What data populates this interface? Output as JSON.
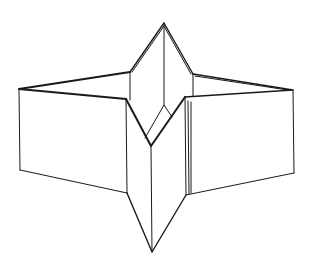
{
  "diagram": {
    "colors": {
      "background": "#ffffff",
      "stroke": "#1a1a1a"
    },
    "vertices": {
      "top_apex": [
        164,
        23
      ],
      "upper_left_shoulder": [
        130,
        72
      ],
      "upper_right_shoulder": [
        193,
        74
      ],
      "left_outer_top": [
        19,
        89
      ],
      "left_outer_bottom": [
        20,
        170
      ],
      "left_inner_top": [
        126,
        99
      ],
      "left_inner_bottom": [
        127,
        193
      ],
      "right_outer_top": [
        293,
        90
      ],
      "right_outer_bottom": [
        294,
        173
      ],
      "right_inner_top": [
        185,
        97
      ],
      "right_inner_bottom": [
        186,
        195
      ],
      "center_v": [
        151,
        146
      ],
      "center_diamond_top": [
        164,
        105
      ],
      "bottom_tip": [
        152,
        252
      ]
    }
  }
}
